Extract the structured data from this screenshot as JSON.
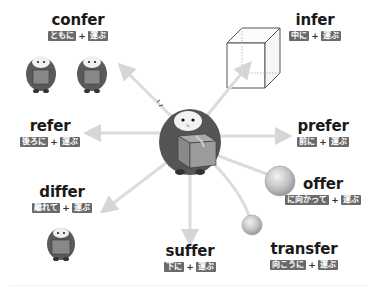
{
  "diagram": {
    "center": {
      "label": "penguin-carrying-box",
      "meaning": "運ぶ"
    },
    "words": [
      {
        "id": "confer",
        "word": "confer",
        "prefix": "ともに",
        "plus": "+",
        "root": "運ぶ"
      },
      {
        "id": "infer",
        "word": "infer",
        "prefix": "中に",
        "plus": "+",
        "root": "運ぶ"
      },
      {
        "id": "refer",
        "word": "refer",
        "prefix": "後ろに",
        "plus": "+",
        "root": "運ぶ"
      },
      {
        "id": "prefer",
        "word": "prefer",
        "prefix": "前に",
        "plus": "+",
        "root": "運ぶ"
      },
      {
        "id": "offer",
        "word": "offer",
        "prefix": "に向かって",
        "plus": "+",
        "root": "運ぶ"
      },
      {
        "id": "differ",
        "word": "differ",
        "prefix": "離れて",
        "plus": "+",
        "root": "運ぶ"
      },
      {
        "id": "suffer",
        "word": "suffer",
        "prefix": "下に",
        "plus": "+",
        "root": "運ぶ"
      },
      {
        "id": "transfer",
        "word": "transfer",
        "prefix": "向こうに",
        "plus": "+",
        "root": "運ぶ"
      }
    ]
  },
  "colors": {
    "arrow": "#d9d9d9",
    "tag_bg": "#6a6a6a",
    "text": "#1a1a1a",
    "penguin_body": "#4a4a4a",
    "box": "#8a8a8a"
  }
}
